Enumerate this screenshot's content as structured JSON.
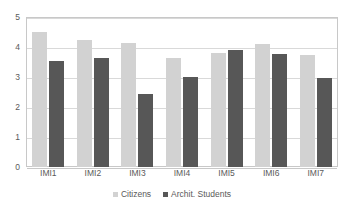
{
  "chart_data": {
    "type": "bar",
    "title": "",
    "subtitle": "",
    "xlabel": "",
    "ylabel": "",
    "categories": [
      "IMI1",
      "IMI2",
      "IMI3",
      "IMI4",
      "IMI5",
      "IMI6",
      "IMI7"
    ],
    "series": [
      {
        "name": "Citizens",
        "color": "#d2d2d2",
        "values": [
          4.5,
          4.22,
          4.14,
          3.62,
          3.8,
          4.1,
          3.72
        ]
      },
      {
        "name": "Archit. Students",
        "color": "#575757",
        "values": [
          3.55,
          3.65,
          2.42,
          3.0,
          3.89,
          3.76,
          2.97
        ]
      }
    ],
    "ylim": [
      0,
      5
    ],
    "yticks": [
      0,
      1,
      2,
      3,
      4,
      5
    ],
    "ytick_labels": [
      "0",
      "1",
      "2",
      "3",
      "4",
      "5"
    ],
    "grid": true,
    "grid_axis": "y",
    "legend_position": "bottom",
    "plot_background": "#ffffff",
    "grid_color": "#d9d9d9",
    "axis_color": "#c8c8c8",
    "tick_label_color": "#5a5a5a"
  }
}
